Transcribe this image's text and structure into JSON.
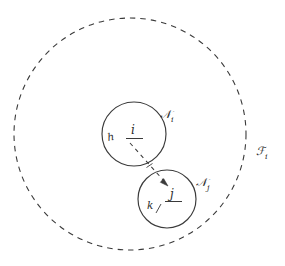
{
  "figure": {
    "background_color": "#ffffff",
    "stroke_color": "#3a3a3a",
    "label_color": "#2b2b2b"
  },
  "outer_region": {
    "name": "outer-dashed-circle",
    "label": "ℱ",
    "subscript": "i",
    "label_full": "ℱᵢ",
    "center_x": 130,
    "center_y": 134,
    "radius": 116,
    "style": "dashed"
  },
  "nodes": [
    {
      "id": "circle-i",
      "set_label": "𝒩",
      "set_subscript": "i",
      "set_label_full": "𝒩ᵢ",
      "center_x": 134,
      "center_y": 134,
      "radius": 32,
      "style": "solid",
      "inner_labels": [
        {
          "id": "label-h",
          "text": "h",
          "x": 113,
          "y": 140
        },
        {
          "id": "label-i",
          "text": "i",
          "x": 133,
          "y": 133,
          "underlined": true
        }
      ]
    },
    {
      "id": "circle-j",
      "set_label": "𝒩",
      "set_subscript": "j",
      "set_label_full": "𝒩ⱼ",
      "center_x": 167,
      "center_y": 199,
      "radius": 29,
      "style": "solid",
      "inner_labels": [
        {
          "id": "label-k",
          "text": "k",
          "x": 150,
          "y": 208
        },
        {
          "id": "label-j",
          "text": "j",
          "x": 172,
          "y": 196,
          "underlined": true
        }
      ]
    }
  ],
  "arrow": {
    "id": "dashed-arrow-i-to-j",
    "from_x": 130,
    "from_y": 143,
    "to_x": 168,
    "to_y": 186,
    "style": "dashed",
    "has_arrowhead": true
  },
  "labels": {
    "set_i": "𝒩",
    "set_i_sub": "i",
    "set_j": "𝒩",
    "set_j_sub": "j",
    "region": "ℱ",
    "region_sub": "i",
    "node_h": "h",
    "node_i": "i",
    "node_k": "k",
    "node_j": "j"
  }
}
